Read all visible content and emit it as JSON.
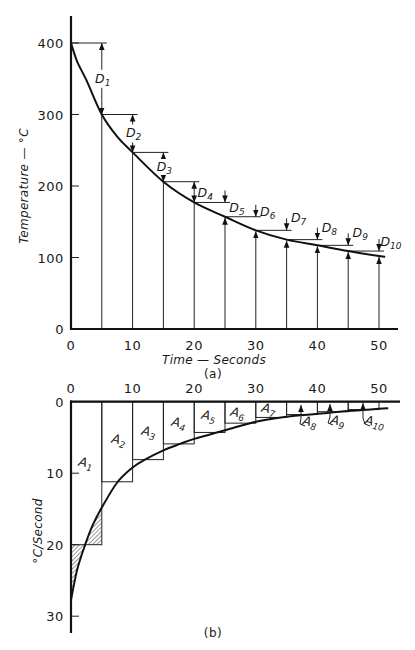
{
  "figure": {
    "panel_a": {
      "caption": "(a)",
      "xlabel": "Time — Seconds",
      "ylabel": "Temperature — °C",
      "x_ticks": [
        "0",
        "10",
        "20",
        "30",
        "40",
        "50"
      ],
      "y_ticks": [
        "0",
        "100",
        "200",
        "300",
        "400"
      ]
    },
    "panel_b": {
      "caption": "(b)",
      "ylabel": "°C/Second",
      "x_ticks": [
        "0",
        "10",
        "20",
        "30",
        "40",
        "50"
      ],
      "y_ticks": [
        "0",
        "10",
        "20",
        "30"
      ]
    }
  },
  "chart_data": [
    {
      "type": "line",
      "panel": "a",
      "title": "",
      "xlabel": "Time — Seconds",
      "ylabel": "Temperature — °C",
      "xlim": [
        0,
        53
      ],
      "ylim": [
        0,
        440
      ],
      "x_ticks": [
        0,
        10,
        20,
        30,
        40,
        50
      ],
      "y_ticks": [
        0,
        100,
        200,
        300,
        400
      ],
      "grid": false,
      "series": [
        {
          "name": "Temperature curve",
          "x": [
            0,
            1,
            2.5,
            5,
            7.5,
            10,
            15,
            20,
            25,
            30,
            35,
            40,
            45,
            50,
            51
          ],
          "y": [
            400,
            374,
            348,
            300,
            269,
            247,
            206,
            177,
            157,
            138,
            125,
            117,
            109,
            102,
            101
          ]
        }
      ],
      "steps": {
        "t": [
          0,
          5,
          10,
          15,
          20,
          25,
          30,
          35,
          40,
          45,
          50
        ],
        "T": [
          400,
          300,
          247,
          206,
          177,
          157,
          138,
          125,
          117,
          109,
          102
        ]
      },
      "annotations": [
        {
          "letter": "D",
          "sub": "1",
          "t": 5,
          "value": 100
        },
        {
          "letter": "D",
          "sub": "2",
          "t": 10,
          "value": 53
        },
        {
          "letter": "D",
          "sub": "3",
          "t": 15,
          "value": 41
        },
        {
          "letter": "D",
          "sub": "4",
          "t": 20,
          "value": 29
        },
        {
          "letter": "D",
          "sub": "5",
          "t": 25,
          "value": 20
        },
        {
          "letter": "D",
          "sub": "6",
          "t": 30,
          "value": 19
        },
        {
          "letter": "D",
          "sub": "7",
          "t": 35,
          "value": 13
        },
        {
          "letter": "D",
          "sub": "8",
          "t": 40,
          "value": 8
        },
        {
          "letter": "D",
          "sub": "9",
          "t": 45,
          "value": 8
        },
        {
          "letter": "D",
          "sub": "10",
          "t": 50,
          "value": 7
        }
      ]
    },
    {
      "type": "bar",
      "panel": "b",
      "title": "",
      "xlabel": "",
      "ylabel": "°C/Second",
      "xlim": [
        0,
        53
      ],
      "ylim": [
        0,
        32
      ],
      "y_inverted": true,
      "x_ticks": [
        0,
        10,
        20,
        30,
        40,
        50
      ],
      "y_ticks": [
        0,
        10,
        20,
        30
      ],
      "grid": false,
      "categories": [
        "A1",
        "A2",
        "A3",
        "A4",
        "A5",
        "A6",
        "A7",
        "A8",
        "A9",
        "A10"
      ],
      "bins": [
        [
          0,
          5
        ],
        [
          5,
          10
        ],
        [
          10,
          15
        ],
        [
          15,
          20
        ],
        [
          20,
          25
        ],
        [
          25,
          30
        ],
        [
          30,
          35
        ],
        [
          35,
          40
        ],
        [
          40,
          45
        ],
        [
          45,
          50
        ]
      ],
      "values": [
        20,
        11.2,
        8.1,
        5.9,
        4.3,
        3.0,
        2.2,
        1.8,
        1.4,
        1.1
      ],
      "series": [
        {
          "name": "Cooling rate curve",
          "x": [
            0,
            1,
            2.3,
            3.5,
            5,
            7.5,
            10,
            12,
            15,
            17.7,
            20,
            25,
            30,
            35,
            40,
            45,
            50,
            51.5
          ],
          "y": [
            27.7,
            23.5,
            20,
            17.3,
            14.8,
            11.3,
            9.2,
            8.1,
            6.8,
            5.9,
            5.2,
            4.0,
            2.8,
            2.1,
            1.7,
            1.3,
            1.0,
            0.9
          ]
        }
      ],
      "hatched_regions": [
        {
          "t_range": [
            0,
            2.3
          ],
          "between": "curve and 20 °C/s line (below line)"
        },
        {
          "t_range": [
            2.3,
            5
          ],
          "between": "curve and 20 °C/s line (above line)"
        }
      ],
      "annotations": [
        {
          "letter": "A",
          "sub": "1"
        },
        {
          "letter": "A",
          "sub": "2"
        },
        {
          "letter": "A",
          "sub": "3"
        },
        {
          "letter": "A",
          "sub": "4"
        },
        {
          "letter": "A",
          "sub": "5"
        },
        {
          "letter": "A",
          "sub": "6"
        },
        {
          "letter": "A",
          "sub": "7"
        },
        {
          "letter": "A",
          "sub": "8"
        },
        {
          "letter": "A",
          "sub": "9"
        },
        {
          "letter": "A",
          "sub": "10"
        }
      ]
    }
  ]
}
